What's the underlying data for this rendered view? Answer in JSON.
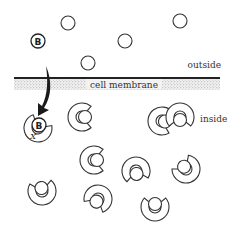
{
  "labels": {
    "outside": "outside",
    "membrane": "cell membrane",
    "inside": "inside",
    "ligand_letter": "B",
    "bound_letter": "B",
    "blocked_mark": "X"
  },
  "colors": {
    "stroke": "#333333",
    "membrane_line": "#222222",
    "stipple": "#c8c8c8",
    "arrow": "#1a1a1a"
  },
  "outside_molecules": [
    {
      "x": 68,
      "y": 23,
      "r": 7
    },
    {
      "x": 125,
      "y": 41,
      "r": 7
    },
    {
      "x": 180,
      "y": 21,
      "r": 7
    },
    {
      "x": 88,
      "y": 63,
      "r": 7
    }
  ],
  "ligand_B": {
    "x": 38,
    "y": 41,
    "r": 7
  },
  "receptors": [
    {
      "x": 82,
      "y": 117,
      "rot": 0
    },
    {
      "x": 162,
      "y": 121,
      "rot": 10
    },
    {
      "x": 180,
      "y": 117,
      "rot": 90
    },
    {
      "x": 94,
      "y": 160,
      "rot": 0
    },
    {
      "x": 42,
      "y": 191,
      "rot": -100
    },
    {
      "x": 98,
      "y": 199,
      "rot": 120
    },
    {
      "x": 136,
      "y": 171,
      "rot": 80
    },
    {
      "x": 186,
      "y": 169,
      "rot": -130
    },
    {
      "x": 155,
      "y": 207,
      "rot": -90
    }
  ],
  "bound_receptor": {
    "x": 38,
    "y": 128,
    "rot": -60
  }
}
